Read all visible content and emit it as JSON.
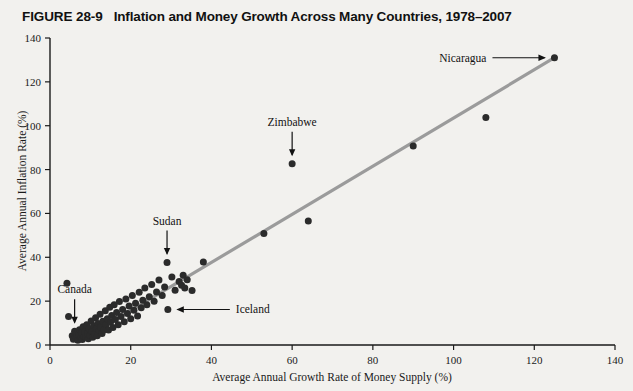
{
  "figure": {
    "number": "FIGURE 28-9",
    "title": "Inflation and Money Growth Across Many Countries, 1978–2007"
  },
  "chart_data": {
    "type": "scatter",
    "title": "Inflation and Money Growth Across Many Countries, 1978–2007",
    "xlabel": "Average Annual Growth Rate of Money Supply (%)",
    "ylabel": "Average Annual Inflation Rate (%)",
    "xlim": [
      0,
      140
    ],
    "ylim": [
      0,
      140
    ],
    "xticks": [
      0,
      20,
      40,
      60,
      80,
      100,
      120,
      140
    ],
    "yticks": [
      0,
      20,
      40,
      60,
      80,
      100,
      120,
      140
    ],
    "grid": false,
    "legend": "none",
    "marker_color": "#2b2b2b",
    "trend_line": {
      "color": "#9b9b9b",
      "x_start": 13,
      "y_start": 8,
      "x_end": 125,
      "y_end": 131
    },
    "points": [
      {
        "x": 4.2,
        "y": 28.2
      },
      {
        "x": 4.6,
        "y": 13.0
      },
      {
        "x": 5.5,
        "y": 4.2
      },
      {
        "x": 5.8,
        "y": 2.6
      },
      {
        "x": 6.1,
        "y": 6.3
      },
      {
        "x": 6.4,
        "y": 3.3
      },
      {
        "x": 6.6,
        "y": 5.1
      },
      {
        "x": 6.9,
        "y": 2.2
      },
      {
        "x": 7.1,
        "y": 4.6
      },
      {
        "x": 7.3,
        "y": 7.0
      },
      {
        "x": 7.6,
        "y": 3.0
      },
      {
        "x": 7.8,
        "y": 5.6
      },
      {
        "x": 8.0,
        "y": 2.5
      },
      {
        "x": 8.2,
        "y": 8.3
      },
      {
        "x": 8.4,
        "y": 4.0
      },
      {
        "x": 8.6,
        "y": 6.0
      },
      {
        "x": 8.9,
        "y": 3.6
      },
      {
        "x": 9.1,
        "y": 9.2
      },
      {
        "x": 9.3,
        "y": 5.4
      },
      {
        "x": 9.5,
        "y": 2.9
      },
      {
        "x": 9.7,
        "y": 7.4
      },
      {
        "x": 9.9,
        "y": 4.4
      },
      {
        "x": 10.2,
        "y": 11.0
      },
      {
        "x": 10.4,
        "y": 6.2
      },
      {
        "x": 10.6,
        "y": 3.5
      },
      {
        "x": 10.8,
        "y": 8.8
      },
      {
        "x": 11.0,
        "y": 5.0
      },
      {
        "x": 11.3,
        "y": 12.4
      },
      {
        "x": 11.5,
        "y": 7.6
      },
      {
        "x": 11.7,
        "y": 4.2
      },
      {
        "x": 11.9,
        "y": 9.8
      },
      {
        "x": 12.2,
        "y": 6.6
      },
      {
        "x": 12.4,
        "y": 14.0
      },
      {
        "x": 12.6,
        "y": 8.2
      },
      {
        "x": 12.9,
        "y": 5.2
      },
      {
        "x": 13.1,
        "y": 10.8
      },
      {
        "x": 13.4,
        "y": 7.0
      },
      {
        "x": 13.7,
        "y": 15.6
      },
      {
        "x": 13.9,
        "y": 9.4
      },
      {
        "x": 14.2,
        "y": 12.0
      },
      {
        "x": 14.5,
        "y": 6.8
      },
      {
        "x": 14.8,
        "y": 17.2
      },
      {
        "x": 15.0,
        "y": 10.4
      },
      {
        "x": 15.3,
        "y": 13.4
      },
      {
        "x": 15.6,
        "y": 8.0
      },
      {
        "x": 15.9,
        "y": 18.4
      },
      {
        "x": 16.2,
        "y": 11.6
      },
      {
        "x": 16.5,
        "y": 14.8
      },
      {
        "x": 16.9,
        "y": 9.2
      },
      {
        "x": 17.2,
        "y": 19.8
      },
      {
        "x": 17.6,
        "y": 13.0
      },
      {
        "x": 18.0,
        "y": 16.2
      },
      {
        "x": 18.4,
        "y": 10.6
      },
      {
        "x": 18.8,
        "y": 21.0
      },
      {
        "x": 19.2,
        "y": 14.4
      },
      {
        "x": 19.6,
        "y": 17.8
      },
      {
        "x": 20.0,
        "y": 12.0
      },
      {
        "x": 20.4,
        "y": 22.6
      },
      {
        "x": 20.8,
        "y": 15.8
      },
      {
        "x": 21.2,
        "y": 19.0
      },
      {
        "x": 21.7,
        "y": 13.2
      },
      {
        "x": 22.1,
        "y": 24.0
      },
      {
        "x": 22.6,
        "y": 17.0
      },
      {
        "x": 23.0,
        "y": 20.4
      },
      {
        "x": 23.5,
        "y": 26.0
      },
      {
        "x": 24.0,
        "y": 18.4
      },
      {
        "x": 24.6,
        "y": 22.0
      },
      {
        "x": 25.2,
        "y": 27.6
      },
      {
        "x": 25.8,
        "y": 20.0
      },
      {
        "x": 26.4,
        "y": 24.2
      },
      {
        "x": 27.0,
        "y": 29.6
      },
      {
        "x": 27.8,
        "y": 22.6
      },
      {
        "x": 28.4,
        "y": 26.4
      },
      {
        "x": 29.0,
        "y": 37.6
      },
      {
        "x": 29.2,
        "y": 16.2
      },
      {
        "x": 30.2,
        "y": 31.0
      },
      {
        "x": 31.0,
        "y": 25.0
      },
      {
        "x": 32.0,
        "y": 29.0
      },
      {
        "x": 32.6,
        "y": 27.2
      },
      {
        "x": 33.0,
        "y": 31.8
      },
      {
        "x": 33.4,
        "y": 26.0
      },
      {
        "x": 34.0,
        "y": 29.8
      },
      {
        "x": 35.2,
        "y": 24.8
      },
      {
        "x": 38.0,
        "y": 37.8
      },
      {
        "x": 53.0,
        "y": 50.8
      },
      {
        "x": 60.0,
        "y": 82.6
      },
      {
        "x": 64.0,
        "y": 56.6
      },
      {
        "x": 90.0,
        "y": 90.8
      },
      {
        "x": 108.0,
        "y": 103.8
      },
      {
        "x": 125.0,
        "y": 131.0
      }
    ],
    "annotations": [
      {
        "label": "Nicaragua",
        "point_x": 125,
        "point_y": 131,
        "arrow": "right"
      },
      {
        "label": "Zimbabwe",
        "point_x": 60,
        "point_y": 82.6,
        "arrow": "down"
      },
      {
        "label": "Sudan",
        "point_x": 29,
        "point_y": 37.6,
        "arrow": "down"
      },
      {
        "label": "Canada",
        "point_x": 6.1,
        "point_y": 6.3,
        "arrow": "down"
      },
      {
        "label": "Iceland",
        "point_x": 29.2,
        "point_y": 16.2,
        "arrow": "left"
      }
    ]
  }
}
